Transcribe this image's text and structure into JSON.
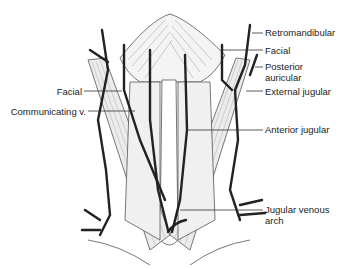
{
  "figure": {
    "colors": {
      "vein": "#222222",
      "muscle_line": "#555555",
      "label": "#222222",
      "background": "#ffffff"
    }
  },
  "labels": {
    "right": [
      {
        "id": "retromandibular",
        "text": "Retromandibular",
        "x": 265,
        "y": 27,
        "line": [
          222,
          33,
          263,
          33
        ]
      },
      {
        "id": "facial-right",
        "text": "Facial",
        "x": 265,
        "y": 45,
        "line": [
          222,
          50,
          263,
          50
        ]
      },
      {
        "id": "posterior-auricular",
        "text": "Posterior\nauricular",
        "x": 265,
        "y": 62,
        "line": [
          252,
          67,
          263,
          67
        ]
      },
      {
        "id": "external-jugular",
        "text": "External jugular",
        "x": 265,
        "y": 86,
        "line": [
          250,
          91,
          263,
          91
        ]
      },
      {
        "id": "anterior-jugular",
        "text": "Anterior jugular",
        "x": 265,
        "y": 124,
        "line": [
          187,
          130,
          263,
          130
        ]
      },
      {
        "id": "jugular-venous-arch",
        "text": "Jugular venous\narch",
        "x": 265,
        "y": 205,
        "line": [
          180,
          210,
          263,
          210
        ]
      }
    ],
    "left": [
      {
        "id": "facial-left",
        "text": "Facial",
        "x": 80,
        "y": 86,
        "line": [
          84,
          91,
          120,
          91
        ]
      },
      {
        "id": "communicating-v",
        "text": "Communicating v.",
        "x": 84,
        "y": 106,
        "line": [
          88,
          111,
          135,
          111
        ]
      }
    ]
  }
}
